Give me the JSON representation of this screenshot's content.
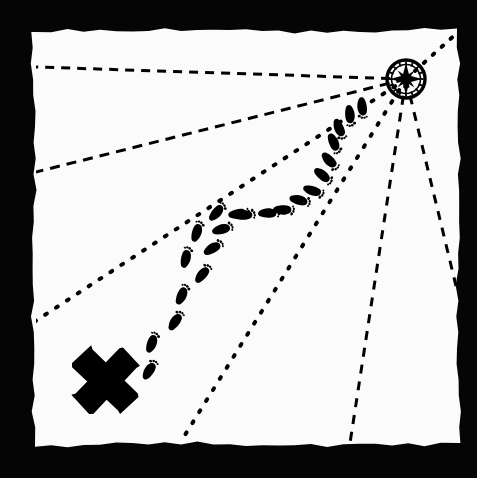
{
  "canvas": {
    "width": 477,
    "height": 478,
    "background_color": "#050505",
    "paper_color": "#fbfbfb",
    "ink_color": "#000000"
  },
  "scene": {
    "title": "treasure-map-illustration",
    "description": "Hand-drawn treasure map: footprint trail from an X mark to a compass rose, with dashed and dotted bearing lines.",
    "paper": {
      "name": "map-paper",
      "x": 35,
      "y": 32,
      "width": 422,
      "height": 411
    },
    "compass": {
      "name": "compass-rose",
      "cx": 406,
      "cy": 79,
      "r": 19,
      "label": "compass-rose"
    },
    "x_mark": {
      "name": "x-marks-the-spot",
      "cx": 106,
      "cy": 380,
      "size": 70,
      "stroke": 26,
      "label": "X"
    },
    "bearing_lines": [
      {
        "name": "bearing-line-west-horizontal",
        "style": "dashed",
        "x1": 406,
        "y1": 79,
        "x2": 36,
        "y2": 67,
        "dash": "9 7",
        "width": 3
      },
      {
        "name": "bearing-line-west-southwest",
        "style": "dashed",
        "x1": 406,
        "y1": 79,
        "x2": 36,
        "y2": 172,
        "dash": "10 7",
        "width": 3
      },
      {
        "name": "bearing-line-southwest-dotted",
        "style": "dotted",
        "x1": 406,
        "y1": 79,
        "x2": 34,
        "y2": 322,
        "dash": "2 11",
        "width": 4
      },
      {
        "name": "bearing-line-south-southwest",
        "style": "dotted",
        "x1": 406,
        "y1": 79,
        "x2": 180,
        "y2": 443,
        "dash": "2 11",
        "width": 4
      },
      {
        "name": "bearing-line-south",
        "style": "dashed",
        "x1": 406,
        "y1": 79,
        "x2": 350,
        "y2": 443,
        "dash": "9 8",
        "width": 3
      },
      {
        "name": "bearing-line-southeast",
        "style": "dashed",
        "x1": 406,
        "y1": 79,
        "x2": 457,
        "y2": 290,
        "dash": "9 8",
        "width": 3
      },
      {
        "name": "bearing-line-northeast",
        "style": "dotted",
        "x1": 406,
        "y1": 79,
        "x2": 457,
        "y2": 33,
        "dash": "2 10",
        "width": 4
      }
    ],
    "footprint_trail": {
      "name": "footprint-trail",
      "count": 22,
      "from": "x-marks-the-spot",
      "to": "compass-rose",
      "prints": [
        {
          "x": 150,
          "y": 371,
          "rot": 28,
          "side": "left"
        },
        {
          "x": 151,
          "y": 343,
          "rot": 25,
          "side": "right"
        },
        {
          "x": 176,
          "y": 322,
          "rot": 30,
          "side": "left"
        },
        {
          "x": 181,
          "y": 295,
          "rot": 28,
          "side": "right"
        },
        {
          "x": 203,
          "y": 275,
          "rot": 35,
          "side": "left"
        },
        {
          "x": 185,
          "y": 258,
          "rot": 18,
          "side": "right"
        },
        {
          "x": 213,
          "y": 249,
          "rot": 55,
          "side": "left"
        },
        {
          "x": 196,
          "y": 232,
          "rot": 22,
          "side": "right"
        },
        {
          "x": 222,
          "y": 230,
          "rot": 70,
          "side": "left"
        },
        {
          "x": 216,
          "y": 212,
          "rot": 45,
          "side": "right"
        },
        {
          "x": 244,
          "y": 216,
          "rot": 80,
          "side": "left"
        },
        {
          "x": 238,
          "y": 213,
          "rot": 85,
          "side": "right"
        },
        {
          "x": 268,
          "y": 214,
          "rot": 85,
          "side": "left"
        },
        {
          "x": 283,
          "y": 209,
          "rot": 95,
          "side": "right"
        },
        {
          "x": 299,
          "y": 201,
          "rot": 100,
          "side": "left"
        },
        {
          "x": 313,
          "y": 190,
          "rot": 112,
          "side": "right"
        },
        {
          "x": 322,
          "y": 176,
          "rot": 125,
          "side": "left"
        },
        {
          "x": 330,
          "y": 160,
          "rot": 140,
          "side": "right"
        },
        {
          "x": 333,
          "y": 143,
          "rot": 152,
          "side": "left"
        },
        {
          "x": 340,
          "y": 128,
          "rot": 162,
          "side": "right"
        },
        {
          "x": 349,
          "y": 115,
          "rot": 170,
          "side": "left"
        },
        {
          "x": 363,
          "y": 107,
          "rot": 178,
          "side": "right"
        }
      ]
    }
  },
  "legend": {
    "x_mark_label": "X",
    "compass_label": "compass-rose",
    "trail_label": "footprints"
  }
}
